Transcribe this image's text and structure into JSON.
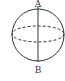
{
  "diagram": {
    "type": "sphere",
    "labels": {
      "top": "A",
      "bottom": "B"
    },
    "elements": [
      {
        "name": "sphere-outline",
        "style": "solid"
      },
      {
        "name": "axis-AB",
        "style": "solid",
        "from": "A",
        "to": "B"
      },
      {
        "name": "equator",
        "style": "dashed"
      }
    ],
    "colors": {
      "stroke": "#333333",
      "background": "#ffffff"
    }
  }
}
